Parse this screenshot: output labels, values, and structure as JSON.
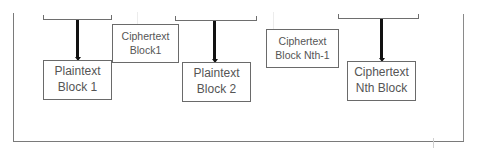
{
  "diagram": {
    "type": "block-cipher-chain",
    "boxes": {
      "plaintext_block_1": {
        "line1": "Plaintext",
        "line2": "Block 1"
      },
      "ciphertext_block_1": {
        "line1": "Ciphertext",
        "line2": "Block1"
      },
      "plaintext_block_2": {
        "line1": "Plaintext",
        "line2": "Block 2"
      },
      "ciphertext_block_nth_minus_1": {
        "line1": "Ciphertext",
        "line2": "Block Nth-1"
      },
      "ciphertext_nth_block": {
        "line1": "Ciphertext",
        "line2": "Nth Block"
      }
    },
    "colors": {
      "arrow": "#111111",
      "border": "#6a6a6a",
      "text": "#555555",
      "background": "#ffffff"
    }
  }
}
